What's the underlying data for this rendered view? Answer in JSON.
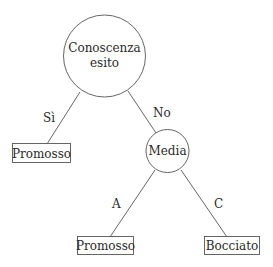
{
  "diagram": {
    "type": "decision-tree",
    "nodes": {
      "root": {
        "label_line1": "Conoscenza",
        "label_line2": "esito",
        "shape": "circle"
      },
      "leaf_left": {
        "label": "Promosso",
        "shape": "box"
      },
      "media": {
        "label": "Media",
        "shape": "circle"
      },
      "leaf_a": {
        "label": "Promosso",
        "shape": "box"
      },
      "leaf_c": {
        "label": "Bocciato",
        "shape": "box"
      }
    },
    "edges": {
      "root_left": {
        "label": "Sì"
      },
      "root_media": {
        "label": "No"
      },
      "media_a": {
        "label": "A"
      },
      "media_c": {
        "label": "C"
      }
    },
    "colors": {
      "stroke": "#555555",
      "text": "#2a2a2a",
      "background": "#ffffff"
    }
  }
}
